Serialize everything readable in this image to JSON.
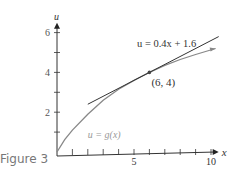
{
  "caption": "Figure 3",
  "chart_data": {
    "type": "line",
    "title": "",
    "xlabel": "x",
    "ylabel": "u",
    "xlim": [
      0,
      10.5
    ],
    "ylim": [
      0,
      6.5
    ],
    "x_ticks": [
      1,
      2,
      3,
      4,
      5,
      6,
      7,
      8,
      9,
      10
    ],
    "x_tick_labels": {
      "5": "5",
      "10": "10"
    },
    "y_ticks": [
      1,
      2,
      3,
      4,
      5,
      6
    ],
    "y_tick_labels": {
      "2": "2",
      "4": "4",
      "6": "6"
    },
    "grid": false,
    "series": [
      {
        "name": "u = g(x)",
        "label": "u = g(x)",
        "color": "#888888",
        "type": "curve",
        "x": [
          0,
          0.5,
          1,
          2,
          3,
          4,
          5,
          6,
          7,
          8,
          9,
          10.3
        ],
        "y": [
          0,
          0.62,
          1.1,
          1.9,
          2.6,
          3.15,
          3.6,
          4.0,
          4.35,
          4.65,
          4.9,
          5.2
        ]
      },
      {
        "name": "u = 0.4x + 1.6",
        "label": "u = 0.4x + 1.6",
        "color": "#333333",
        "type": "tangent-line",
        "x": [
          2,
          10.5
        ],
        "y": [
          2.4,
          5.8
        ]
      }
    ],
    "annotations": [
      {
        "text": "(6, 4)",
        "x": 6,
        "y": 4,
        "marker": true
      },
      {
        "text": "u = 0.4x + 1.6",
        "x": 5.2,
        "y": 5.4
      },
      {
        "text": "u = g(x)",
        "x": 2,
        "y": 0.8
      }
    ]
  }
}
